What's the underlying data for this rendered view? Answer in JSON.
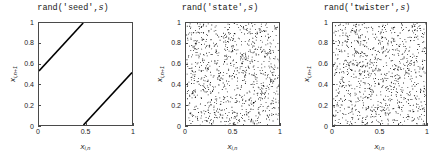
{
  "figure": {
    "background": "#ffffff",
    "axis_color": "#4a4a4a",
    "data_color": "#000000"
  },
  "axis_labels": {
    "x_var": "x",
    "x_sub": "i,n",
    "y_var": "x",
    "y_sub": "i,n+1"
  },
  "panels": [
    {
      "title_prefix": "rand('seed',",
      "title_italic": "s",
      "title_suffix": ")",
      "title_full": "rand('seed',s)"
    },
    {
      "title_prefix": "rand('state',",
      "title_italic": "s",
      "title_suffix": ")",
      "title_full": "rand('state',s)"
    },
    {
      "title_prefix": "rand('twister',",
      "title_italic": "s",
      "title_suffix": ")",
      "title_full": "rand('twister',s)"
    }
  ],
  "ticks": {
    "x": [
      "0",
      "0.5",
      "1"
    ],
    "x_values": [
      0,
      0.5,
      1
    ],
    "y": [
      "0",
      "0.2",
      "0.4",
      "0.6",
      "0.8",
      "1"
    ],
    "y_values": [
      0,
      0.2,
      0.4,
      0.6,
      0.8,
      1
    ]
  },
  "chart_data": [
    {
      "type": "line",
      "title": "rand('seed',s)",
      "xlabel": "x_{i,n}",
      "ylabel": "x_{i,n+1}",
      "xlim": [
        0,
        1
      ],
      "ylim": [
        0,
        1
      ],
      "grid": false,
      "legend": "none",
      "note": "Degenerate lattice structure: successive pairs fall on two parallel line segments of slope ~1.02",
      "series": [
        {
          "name": "lattice-line-upper",
          "x": [
            0.0,
            0.475
          ],
          "y": [
            0.53,
            1.0
          ]
        },
        {
          "name": "lattice-line-lower",
          "x": [
            0.478,
            1.0
          ],
          "y": [
            0.0,
            0.515
          ]
        }
      ]
    },
    {
      "type": "scatter",
      "title": "rand('state',s)",
      "xlabel": "x_{i,n}",
      "ylabel": "x_{i,n+1}",
      "xlim": [
        0,
        1
      ],
      "ylim": [
        0,
        1
      ],
      "grid": false,
      "legend": "none",
      "marker": "dot",
      "marker_size_px": 1,
      "n_points": 1000,
      "note": "Uniformly distributed scatter filling the unit square with no visible lattice structure",
      "seed": 20240517
    },
    {
      "type": "scatter",
      "title": "rand('twister',s)",
      "xlabel": "x_{i,n}",
      "ylabel": "x_{i,n+1}",
      "xlim": [
        0,
        1
      ],
      "ylim": [
        0,
        1
      ],
      "grid": false,
      "legend": "none",
      "marker": "dot",
      "marker_size_px": 1,
      "n_points": 1000,
      "note": "Uniformly distributed scatter filling the unit square with no visible lattice structure",
      "seed": 71130041
    }
  ]
}
